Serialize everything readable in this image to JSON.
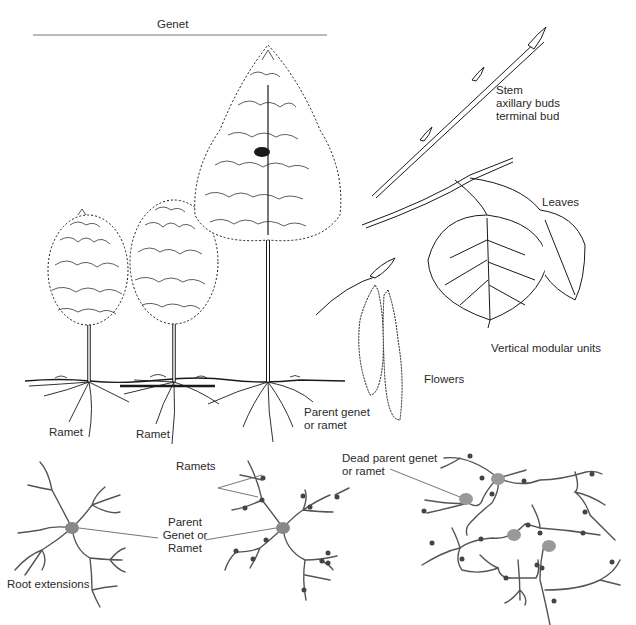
{
  "title": "Genet",
  "top_section": {
    "trees": [
      {
        "label": "Ramet",
        "role": "ramet"
      },
      {
        "label": "Ramet",
        "role": "ramet"
      },
      {
        "label": "Parent genet\nor ramet",
        "role": "parent"
      }
    ],
    "stem_labels": [
      "Stem",
      "axillary buds",
      "terminal bud"
    ],
    "leaves_label": "Leaves",
    "modules_label": "Vertical modular units",
    "flowers_label": "Flowers",
    "parent_label_line1": "Parent genet",
    "parent_label_line2": "or ramet",
    "ramet_label_1": "Ramet",
    "ramet_label_2": "Ramet"
  },
  "bottom_section": {
    "ramets_label": "Ramets",
    "parent_center_label": [
      "Parent",
      "Genet or",
      "Ramet"
    ],
    "root_extensions_label": "Root extensions",
    "dead_parent_label": [
      "Dead parent genet",
      "or ramet"
    ]
  },
  "colors": {
    "ink": "#1a1a1a",
    "root_line": "#555555",
    "node_fill": "#888888",
    "small_node": "#444444"
  }
}
